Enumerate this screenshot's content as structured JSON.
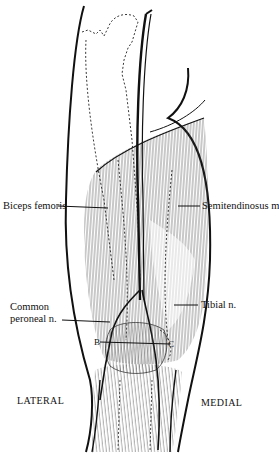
{
  "figure": {
    "labels": {
      "biceps_femoris": "Biceps femoris",
      "semitendinosus": "Semitendinosus m.",
      "common_peroneal_line1": "Common",
      "common_peroneal_line2": "peroneal n.",
      "tibial": "Tibial n.",
      "lateral": "LATERAL",
      "medial": "MEDIAL",
      "marker_b": "B",
      "marker_c": "C"
    },
    "colors": {
      "ink": "#111111",
      "background": "#ffffff",
      "hatch": "#555555"
    }
  }
}
